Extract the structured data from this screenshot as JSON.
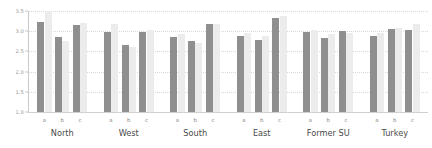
{
  "chart_data": {
    "type": "bar",
    "title": "",
    "xlabel": "",
    "ylabel": "",
    "ylim": [
      1.0,
      3.5
    ],
    "grid": true,
    "grid_axis": "y",
    "legend": false,
    "yticks": [
      "3.5",
      "3.0",
      "2.5",
      "2.0",
      "1.5",
      "1.0"
    ],
    "ytick_values": [
      3.5,
      3.0,
      2.5,
      2.0,
      1.5,
      1.0
    ],
    "groups": [
      "North",
      "West",
      "South",
      "East",
      "Former SU",
      "Turkey"
    ],
    "subcategories": [
      "a",
      "b",
      "c"
    ],
    "colors": {
      "series_0": "#8f8f8f",
      "series_1": "#ececec",
      "gridline": "#d8d8d8",
      "axis": "#c9c9c9",
      "tick_label": "#999999",
      "group_label": "#4a4a4a"
    },
    "series": [
      {
        "name": "series_0",
        "values": [
          [
            3.22,
            2.85,
            3.15
          ],
          [
            2.97,
            2.66,
            2.97
          ],
          [
            2.86,
            2.77,
            3.19
          ],
          [
            2.88,
            2.79,
            3.33
          ],
          [
            2.98,
            2.83,
            3.0
          ],
          [
            2.87,
            3.05,
            3.03
          ]
        ]
      },
      {
        "name": "series_1",
        "values": [
          [
            3.5,
            2.76,
            3.2
          ],
          [
            3.18,
            2.61,
            3.02
          ],
          [
            2.93,
            2.7,
            3.19
          ],
          [
            2.95,
            2.87,
            3.37
          ],
          [
            3.02,
            2.93,
            2.96
          ],
          [
            2.95,
            3.07,
            3.18
          ]
        ]
      }
    ]
  }
}
